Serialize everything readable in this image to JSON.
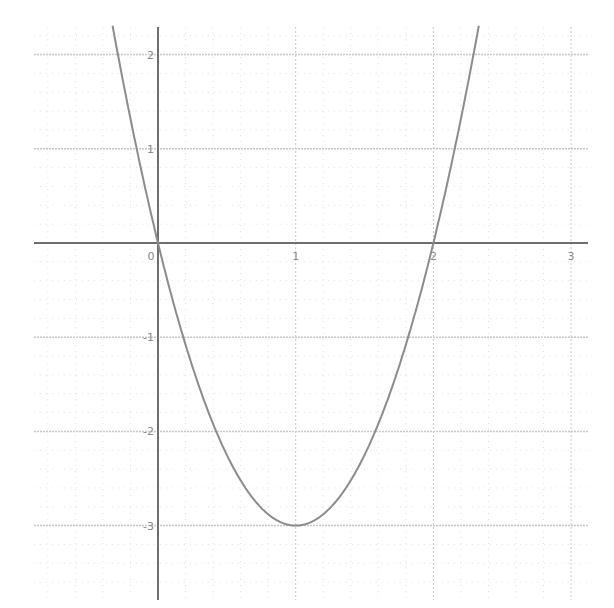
{
  "chart_data": {
    "type": "line",
    "title": "",
    "xlabel": "",
    "ylabel": "",
    "function": "y = 3x^2 - 6x",
    "xlim": [
      -0.9,
      3.1
    ],
    "ylim": [
      -3.75,
      2.3
    ],
    "grid": true,
    "minor_grid_subdivisions": 5,
    "x_ticks": [
      0,
      1,
      2,
      3
    ],
    "x_tick_labels": [
      "0",
      "1",
      "2",
      "3"
    ],
    "y_ticks": [
      2,
      1,
      -1,
      -2,
      -3
    ],
    "y_tick_labels": [
      "2",
      "1",
      "-1",
      "-2",
      "-3"
    ],
    "key_points": [
      {
        "label": "root",
        "x": 0,
        "y": 0
      },
      {
        "label": "vertex",
        "x": 1,
        "y": -3
      },
      {
        "label": "root",
        "x": 2,
        "y": 0
      }
    ],
    "series": [
      {
        "name": "parabola",
        "x": [
          -0.33,
          -0.2,
          0,
          0.25,
          0.5,
          0.75,
          1,
          1.25,
          1.5,
          1.75,
          2,
          2.2,
          2.33
        ],
        "values": [
          2.31,
          1.32,
          0,
          -1.31,
          -2.25,
          -2.81,
          -3,
          -2.81,
          -2.25,
          -1.31,
          0,
          1.32,
          2.31
        ]
      }
    ],
    "legend": null
  },
  "colors": {
    "background": "#ffffff",
    "axis": "#6e6e6e",
    "major_grid": "#c8c8c8",
    "minor_grid": "#e2e2e2",
    "curve": "#8c8c8c",
    "label": "#8a8a8a"
  }
}
